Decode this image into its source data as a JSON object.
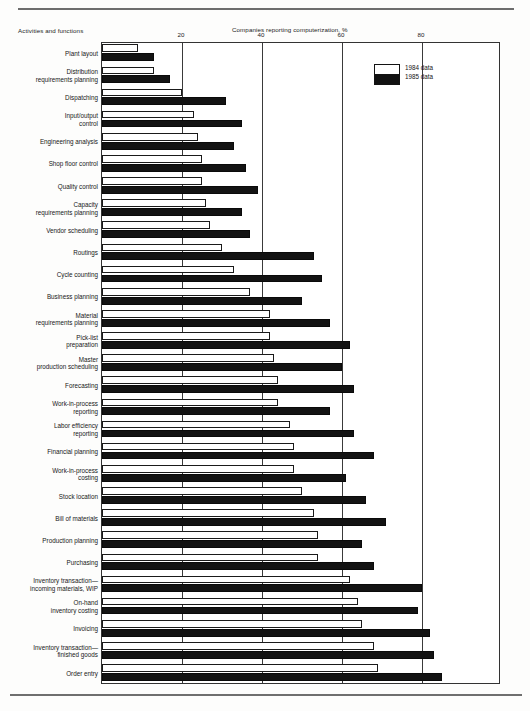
{
  "chart_data": {
    "type": "bar",
    "orientation": "horizontal",
    "title": "",
    "xlabel": "Companies reporting computerization, %",
    "ylabel": "Activities and functions",
    "xlim": [
      0,
      100
    ],
    "xticks": [
      20,
      40,
      60,
      80
    ],
    "grid": true,
    "legend_position": "top-right-inside",
    "categories": [
      "Plant layout",
      "Distribution\nrequirements planning",
      "Dispatching",
      "Input/output\ncontrol",
      "Engineering analysis",
      "Shop floor control",
      "Quality control",
      "Capacity\nrequirements planning",
      "Vendor scheduling",
      "Routings",
      "Cycle counting",
      "Business planning",
      "Material\nrequirements planning",
      "Pick-list\npreparation",
      "Master\nproduction scheduling",
      "Forecasting",
      "Work-in-process\nreporting",
      "Labor efficiency\nreporting",
      "Financial planning",
      "Work-in-process\ncosting",
      "Stock location",
      "Bill of materials",
      "Production planning",
      "Purchasing",
      "Inventory transaction—\nincoming materials, WIP",
      "On-hand\ninventory costing",
      "Invoicing",
      "Inventory transaction—\nfinished goods",
      "Order entry"
    ],
    "series": [
      {
        "name": "1984 data",
        "color": "#ffffff",
        "edge_color": "#1a1a1a",
        "values": [
          9,
          13,
          20,
          23,
          24,
          25,
          25,
          26,
          27,
          30,
          33,
          37,
          42,
          42,
          43,
          44,
          44,
          47,
          48,
          48,
          50,
          53,
          54,
          54,
          62,
          64,
          65,
          68,
          69
        ]
      },
      {
        "name": "1985 data",
        "color": "#131313",
        "edge_color": "#0a0a0a",
        "values": [
          13,
          17,
          31,
          35,
          33,
          36,
          39,
          35,
          37,
          53,
          55,
          50,
          57,
          62,
          60,
          63,
          57,
          63,
          68,
          61,
          66,
          71,
          65,
          68,
          80,
          79,
          82,
          83,
          85
        ]
      }
    ]
  },
  "legend": {
    "items": [
      {
        "label": "1984 data",
        "swatch": "light"
      },
      {
        "label": "1985 data",
        "swatch": "dark"
      }
    ]
  },
  "axis": {
    "left_title": "Activities and functions",
    "top_title": "Companies reporting computerization, %",
    "tick_labels": [
      "20",
      "40",
      "60",
      "80"
    ]
  }
}
